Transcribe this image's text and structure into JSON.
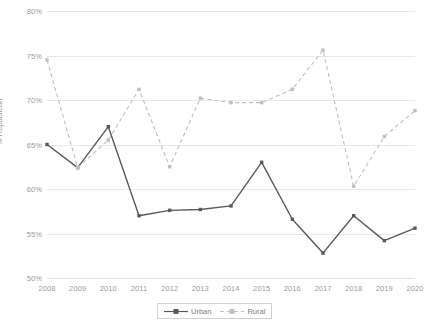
{
  "chart_data": {
    "type": "line",
    "title": "",
    "xlabel": "",
    "ylabel": "% Republican",
    "categories": [
      "2008",
      "2009",
      "2010",
      "2011",
      "2012",
      "2013",
      "2014",
      "2015",
      "2016",
      "2017",
      "2018",
      "2019",
      "2020"
    ],
    "ylim": [
      50,
      80
    ],
    "ytick_values": [
      50,
      55,
      60,
      65,
      70,
      75,
      80
    ],
    "ytick_labels": [
      "50%",
      "55%",
      "60%",
      "65%",
      "70%",
      "75%",
      "80%"
    ],
    "grid": true,
    "legend_position": "bottom-center",
    "series": [
      {
        "name": "Urban",
        "style": "solid",
        "color": "#595959",
        "marker": "square",
        "values": [
          65.0,
          62.4,
          67.0,
          57.0,
          57.6,
          57.7,
          58.1,
          63.0,
          56.6,
          52.8,
          57.0,
          54.2,
          55.6
        ]
      },
      {
        "name": "Rural",
        "style": "dashed",
        "color": "#bfbfbf",
        "marker": "square",
        "values": [
          74.5,
          62.4,
          65.5,
          71.2,
          62.5,
          70.2,
          69.7,
          69.7,
          71.2,
          75.6,
          60.3,
          65.9,
          68.8
        ]
      }
    ]
  },
  "legend": {
    "items": [
      {
        "label": "Urban"
      },
      {
        "label": "Rural"
      }
    ]
  },
  "colors": {
    "urban": "#595959",
    "rural": "#bfbfbf",
    "gridline": "#e8e8e8",
    "tick_text": "#9a9a9a",
    "legend_text": "#7b7b7b",
    "legend_border": "#d0d0d0",
    "background": "#ffffff"
  }
}
